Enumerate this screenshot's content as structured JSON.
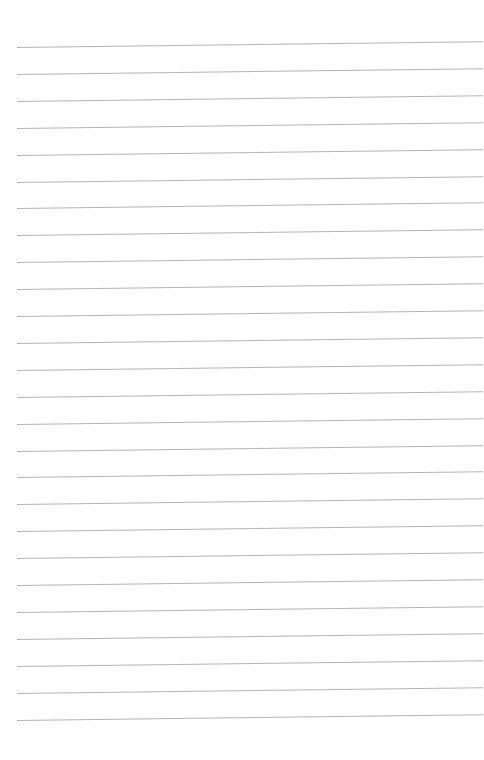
{
  "page": {
    "type": "lined-paper",
    "background_color": "#ffffff",
    "line_color": "#b4b4b4",
    "line_count": 26,
    "first_line_y": 47,
    "line_spacing": 26.9,
    "line_left_x": 17,
    "line_right_x": 483,
    "line_tilt_px": -6,
    "text": []
  }
}
